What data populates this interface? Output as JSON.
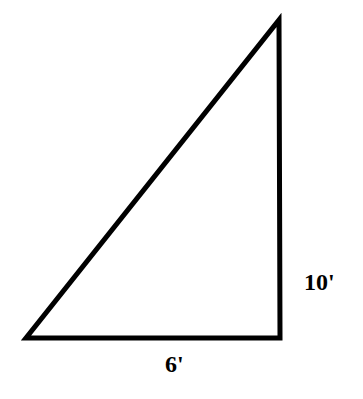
{
  "diagram": {
    "type": "right-triangle",
    "stroke_color": "#000000",
    "background": "#ffffff",
    "vertices": {
      "bottom_left": [
        26,
        338
      ],
      "bottom_right": [
        280,
        338
      ],
      "top": [
        279,
        20
      ]
    },
    "labels": {
      "vertical_side": "10'",
      "base": "6'"
    }
  }
}
